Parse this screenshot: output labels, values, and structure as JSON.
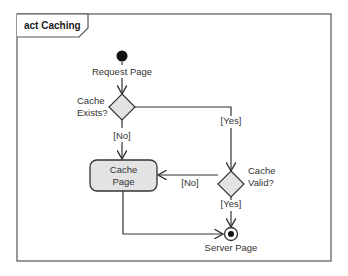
{
  "diagram": {
    "type": "UML activity diagram",
    "frame_title": "act Caching",
    "colors": {
      "stroke": "#333333",
      "node_fill": "#e3e3e3",
      "initial_fill": "#111111"
    },
    "nodes": {
      "initial": {
        "kind": "initial-node",
        "label": "Request Page"
      },
      "decision_exists": {
        "kind": "decision",
        "label_line1": "Cache",
        "label_line2": "Exists?"
      },
      "action_cache": {
        "kind": "action",
        "label_line1": "Cache",
        "label_line2": "Page"
      },
      "decision_valid": {
        "kind": "decision",
        "label_line1": "Cache",
        "label_line2": "Valid?"
      },
      "final": {
        "kind": "activity-final",
        "label": "Server Page"
      }
    },
    "edges": {
      "exists_no": {
        "from": "Cache Exists?",
        "to": "Cache Page",
        "guard": "[No]"
      },
      "exists_yes": {
        "from": "Cache Exists?",
        "to": "Cache Valid?",
        "guard": "[Yes]"
      },
      "valid_no": {
        "from": "Cache Valid?",
        "to": "Cache Page",
        "guard": "[No]"
      },
      "valid_yes": {
        "from": "Cache Valid?",
        "to": "Server Page",
        "guard": "[Yes]"
      },
      "cache_to_final": {
        "from": "Cache Page",
        "to": "Server Page",
        "guard": ""
      },
      "initial_to_exists": {
        "from": "Request Page",
        "to": "Cache Exists?",
        "guard": ""
      }
    }
  }
}
